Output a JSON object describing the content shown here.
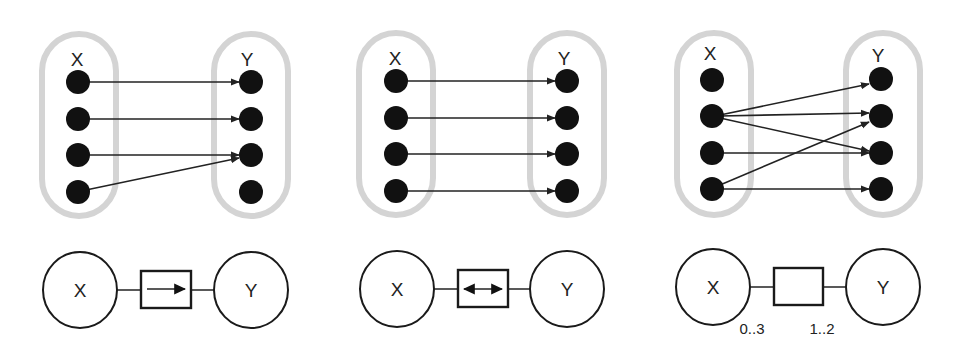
{
  "figure": {
    "panels": [
      {
        "id": "function",
        "set_x_label": "X",
        "set_y_label": "Y",
        "x_elements": 4,
        "y_elements": 4,
        "mappings": [
          [
            0,
            0
          ],
          [
            1,
            1
          ],
          [
            2,
            2
          ],
          [
            3,
            2
          ]
        ],
        "factor": {
          "x_label": "X",
          "y_label": "Y",
          "box_symbol": "right-arrow",
          "multiplicity_x": "",
          "multiplicity_y": ""
        }
      },
      {
        "id": "bijection",
        "set_x_label": "X",
        "set_y_label": "Y",
        "x_elements": 4,
        "y_elements": 4,
        "mappings": [
          [
            0,
            0
          ],
          [
            1,
            1
          ],
          [
            2,
            2
          ],
          [
            3,
            3
          ]
        ],
        "factor": {
          "x_label": "X",
          "y_label": "Y",
          "box_symbol": "double-arrow",
          "multiplicity_x": "",
          "multiplicity_y": ""
        }
      },
      {
        "id": "relation",
        "set_x_label": "X",
        "set_y_label": "Y",
        "x_elements": 4,
        "y_elements": 4,
        "mappings": [
          [
            1,
            0
          ],
          [
            1,
            1
          ],
          [
            1,
            2
          ],
          [
            2,
            2
          ],
          [
            3,
            1
          ],
          [
            3,
            3
          ]
        ],
        "factor": {
          "x_label": "X",
          "y_label": "Y",
          "box_symbol": "none",
          "multiplicity_x": "0..3",
          "multiplicity_y": "1..2"
        }
      }
    ]
  }
}
